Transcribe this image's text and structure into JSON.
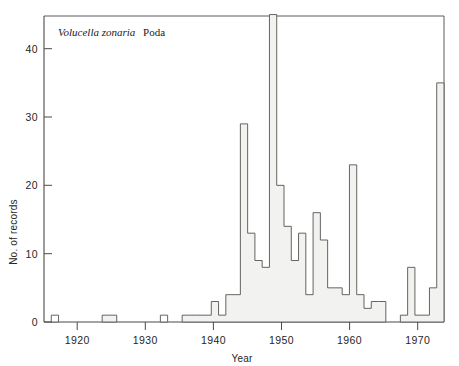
{
  "figure": {
    "caption_italic": "Volucella zonaria",
    "caption_plain": "Poda",
    "background": "#ffffff",
    "line_color": "#55544f",
    "fill_color": "#f2f2f0"
  },
  "chart_data": {
    "type": "bar",
    "title": "Volucella zonaria Poda",
    "xlabel": "Year",
    "ylabel": "No. of records",
    "xlim": [
      1918,
      1973
    ],
    "ylim": [
      0,
      46
    ],
    "yticks": [
      0,
      10,
      20,
      30,
      40
    ],
    "ytick_labels": [
      "0",
      "10",
      "20",
      "30",
      "40"
    ],
    "xticks": [
      1920,
      1930,
      1940,
      1950,
      1960,
      1970
    ],
    "xtick_labels": [
      "1920",
      "1930",
      "1940",
      "1950",
      "1960",
      "1970"
    ],
    "grid": false,
    "legend": "none",
    "bin_width_years": 1,
    "categories": [
      1919,
      1920,
      1921,
      1922,
      1923,
      1924,
      1925,
      1926,
      1927,
      1928,
      1929,
      1930,
      1931,
      1932,
      1933,
      1934,
      1935,
      1936,
      1937,
      1938,
      1939,
      1940,
      1941,
      1942,
      1943,
      1944,
      1945,
      1946,
      1947,
      1948,
      1949,
      1950,
      1951,
      1952,
      1953,
      1954,
      1955,
      1956,
      1957,
      1958,
      1959,
      1960,
      1961,
      1962,
      1963,
      1964,
      1965,
      1966,
      1967,
      1968,
      1969,
      1970,
      1971,
      1972
    ],
    "values": [
      1,
      0,
      0,
      0,
      0,
      0,
      0,
      1,
      1,
      0,
      0,
      0,
      0,
      0,
      0,
      1,
      0,
      0,
      1,
      1,
      1,
      1,
      3,
      1,
      4,
      4,
      29,
      13,
      9,
      8,
      45,
      20,
      14,
      9,
      13,
      4,
      16,
      12,
      5,
      5,
      4,
      23,
      4,
      2,
      3,
      3,
      0,
      0,
      1,
      8,
      1,
      1,
      5,
      35
    ]
  },
  "axis": {
    "y_title": "No. of records",
    "x_title": "Year"
  }
}
